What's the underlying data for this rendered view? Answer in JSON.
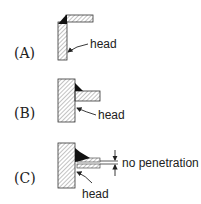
{
  "figures": [
    {
      "id": "A",
      "label": "(A)",
      "callout": "head"
    },
    {
      "id": "B",
      "label": "(B)",
      "callout": "head"
    },
    {
      "id": "C",
      "label": "(C)",
      "callout": "head",
      "dimension_label": "no penetration"
    }
  ],
  "colors": {
    "stroke": "#333333",
    "hatch": "#555555",
    "weld": "#111111",
    "background": "#ffffff"
  }
}
